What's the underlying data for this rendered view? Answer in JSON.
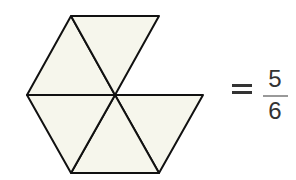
{
  "diagram": {
    "total_parts": 6,
    "shaded_parts": 5,
    "fill_color": "#f6f6ec",
    "stroke_color": "#111111"
  },
  "equation": {
    "equals_sign": "=",
    "numerator": "5",
    "denominator": "6"
  }
}
